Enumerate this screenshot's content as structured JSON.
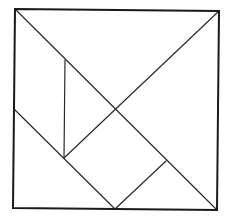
{
  "diagram": {
    "type": "tangram",
    "colors": {
      "background": "#ffffff",
      "stroke": "#1a1a1a"
    },
    "square": {
      "tl": [
        15,
        9
      ],
      "tr": [
        219,
        11
      ],
      "br": [
        217,
        210
      ],
      "bl": [
        13,
        208
      ]
    },
    "points": {
      "center": [
        116,
        110
      ],
      "vertical_top": [
        65,
        60
      ],
      "vertical_bottom": [
        64,
        158
      ],
      "left_mid": [
        14,
        109
      ],
      "bottom_mid": [
        115,
        209
      ],
      "right_junction": [
        166,
        161
      ]
    },
    "pieces": [
      {
        "name": "large-triangle-top",
        "points": "15,9 219,11 116,110"
      },
      {
        "name": "large-triangle-right",
        "points": "219,11 217,210 116,110"
      },
      {
        "name": "medium-triangle-bottom-left",
        "points": "14,109 64,158 115,209 13,208"
      },
      {
        "name": "small-triangle-center",
        "points": "65,60 116,110 64,158"
      },
      {
        "name": "square-piece",
        "points": "64,158 116,110 166,161 115,209"
      },
      {
        "name": "small-triangle-bottom-right",
        "points": "166,161 217,210 115,209"
      },
      {
        "name": "parallelogram-left",
        "points": "15,9 65,60 64,158 14,109"
      }
    ]
  }
}
